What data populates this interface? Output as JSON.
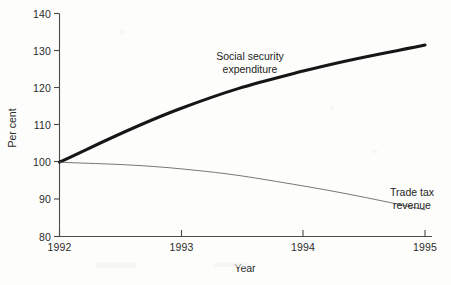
{
  "chart_data": {
    "type": "line",
    "title": "",
    "xlabel": "Year",
    "ylabel": "Per cent",
    "x": [
      1992,
      1993,
      1994,
      1995
    ],
    "xtick_labels": [
      "1992",
      "1993",
      "1994",
      "1995"
    ],
    "ytick_labels": [
      "80",
      "90",
      "100",
      "110",
      "120",
      "130",
      "140"
    ],
    "yticks": [
      80,
      90,
      100,
      110,
      120,
      130,
      140
    ],
    "xlim": [
      1992,
      1995
    ],
    "ylim": [
      80,
      140
    ],
    "grid": false,
    "legend_position": "inline-annotations",
    "series": [
      {
        "name": "Social security expenditure",
        "values": [
          100,
          114.5,
          124.5,
          131.5
        ],
        "style": "thick",
        "color": "#161616",
        "annotation": {
          "line1": "Social security",
          "line2": "expenditure"
        }
      },
      {
        "name": "Trade tax revenue",
        "values": [
          100,
          98.2,
          93.6,
          87.2
        ],
        "style": "thin",
        "color": "#5d5d5d",
        "annotation": {
          "line1": "Trade tax",
          "line2": "revenue"
        }
      }
    ]
  },
  "axes": {
    "y": {
      "label": "Per cent",
      "ticks": [
        {
          "value": "140"
        },
        {
          "value": "130"
        },
        {
          "value": "120"
        },
        {
          "value": "110"
        },
        {
          "value": "100"
        },
        {
          "value": "90"
        },
        {
          "value": "80"
        }
      ]
    },
    "x": {
      "label": "Year",
      "ticks": [
        {
          "value": "1992"
        },
        {
          "value": "1993"
        },
        {
          "value": "1994"
        },
        {
          "value": "1995"
        }
      ]
    }
  },
  "annotations": {
    "social_security": {
      "line1": "Social security",
      "line2": "expenditure"
    },
    "trade_tax": {
      "line1": "Trade tax",
      "line2": "revenue"
    }
  },
  "colors": {
    "thick_series": "#161616",
    "thin_series": "#5d5d5d",
    "axis": "#4a4a4a",
    "text": "#2b2b2b",
    "background": "#fdfdfc"
  }
}
